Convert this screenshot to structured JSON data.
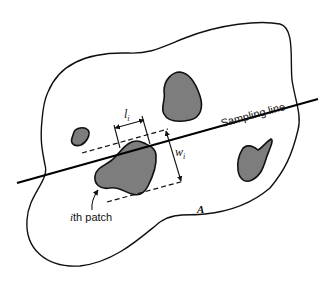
{
  "diagram": {
    "labels": {
      "sampling_line": "Sampling line",
      "li_main": "l",
      "li_sub": "i",
      "wi_main": "w",
      "wi_sub": "i",
      "ith_patch_i": "i",
      "ith_patch_rest": "th patch",
      "area": "A"
    },
    "colors": {
      "patch_fill": "#7d7d7d",
      "stroke": "#111111",
      "background": "#ffffff"
    }
  }
}
